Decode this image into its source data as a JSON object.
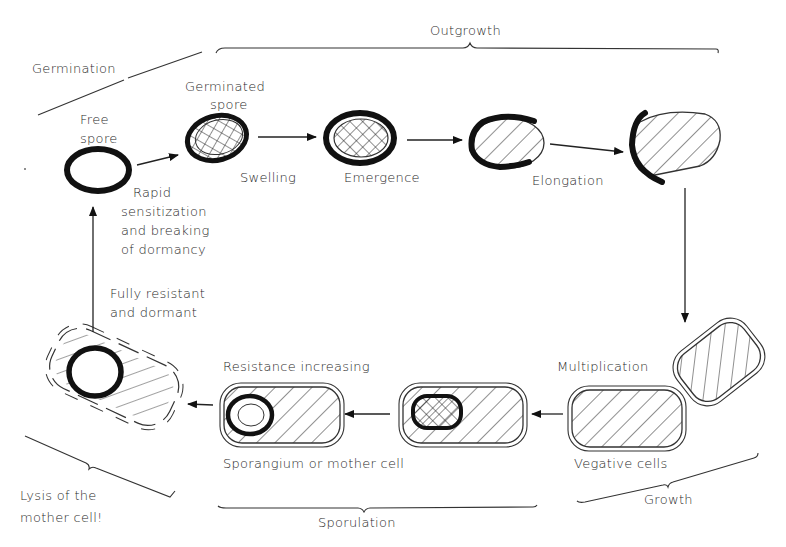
{
  "colors": {
    "ink": "#111111",
    "text": "#2a2a2a",
    "background": "#ffffff"
  },
  "phases": {
    "germination": "Germination",
    "outgrowth": "Outgrowth",
    "growth": "Growth",
    "sporulation": "Sporulation",
    "lysis": [
      "Lysis of the",
      "mother cell!"
    ]
  },
  "stages": {
    "free_spore": [
      "Free",
      "spore"
    ],
    "germinated_spore": [
      "Germinated",
      "spore"
    ],
    "rapid": [
      "Rapid",
      "sensitization",
      "and breaking",
      "of dormancy"
    ],
    "swelling": "Swelling",
    "emergence": "Emergence",
    "elongation": "Elongation",
    "multiplication": "Multiplication",
    "vegetative_cells": "Vegative cells",
    "resistance_increasing": "Resistance increasing",
    "sporangium": "Sporangium or mother cell",
    "fully_resistant": [
      "Fully resistant",
      "and dormant"
    ]
  }
}
